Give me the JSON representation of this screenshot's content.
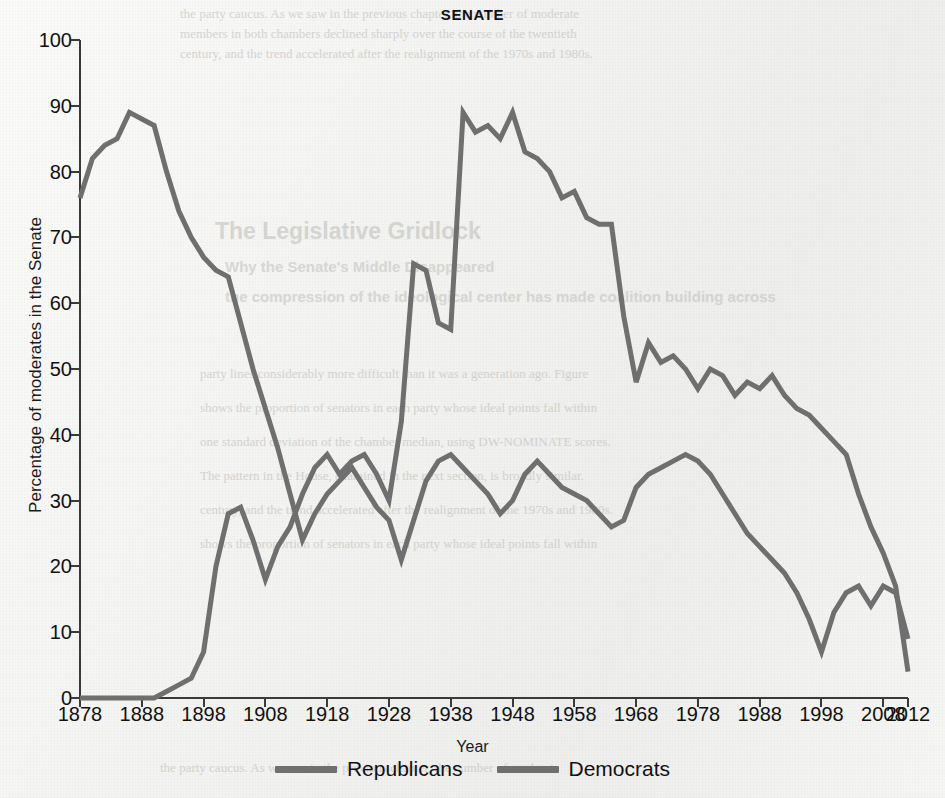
{
  "chart_data": {
    "type": "line",
    "title": "SENATE",
    "xlabel": "Year",
    "ylabel": "Percentage of moderates in the Senate",
    "xlim": [
      1878,
      2012
    ],
    "ylim": [
      0,
      100
    ],
    "grid": false,
    "legend_position": "bottom-center",
    "x_ticks": [
      "1878",
      "1888",
      "1898",
      "1908",
      "1918",
      "1928",
      "1938",
      "1948",
      "1958",
      "1968",
      "1978",
      "1988",
      "1998",
      "2008",
      "2012"
    ],
    "y_ticks": [
      "0",
      "10",
      "20",
      "30",
      "40",
      "50",
      "60",
      "70",
      "80",
      "90",
      "100"
    ],
    "colors": {
      "republicans": "#6f6f6f",
      "democrats": "#6f6f6f",
      "axis": "#3a3a3a",
      "background": "#f2f2f0"
    },
    "x": [
      1878,
      1880,
      1882,
      1884,
      1886,
      1888,
      1890,
      1892,
      1894,
      1896,
      1898,
      1900,
      1902,
      1904,
      1906,
      1908,
      1910,
      1912,
      1914,
      1916,
      1918,
      1920,
      1922,
      1924,
      1926,
      1928,
      1930,
      1932,
      1934,
      1936,
      1938,
      1940,
      1942,
      1944,
      1946,
      1948,
      1950,
      1952,
      1954,
      1956,
      1958,
      1960,
      1962,
      1964,
      1966,
      1968,
      1970,
      1972,
      1974,
      1976,
      1978,
      1980,
      1982,
      1984,
      1986,
      1988,
      1990,
      1992,
      1994,
      1996,
      1998,
      2000,
      2002,
      2004,
      2006,
      2008,
      2010,
      2012
    ],
    "series": [
      {
        "name": "Republicans",
        "values": [
          76,
          82,
          84,
          85,
          89,
          88,
          87,
          80,
          74,
          70,
          67,
          65,
          64,
          57,
          50,
          44,
          38,
          31,
          24,
          28,
          31,
          33,
          35,
          32,
          29,
          27,
          21,
          27,
          33,
          36,
          37,
          35,
          33,
          31,
          28,
          30,
          34,
          36,
          34,
          32,
          31,
          30,
          28,
          26,
          27,
          32,
          34,
          35,
          36,
          37,
          36,
          34,
          31,
          28,
          25,
          23,
          21,
          19,
          16,
          12,
          7,
          13,
          16,
          17,
          14,
          17,
          16,
          9
        ]
      },
      {
        "name": "Democrats",
        "values": [
          0,
          0,
          0,
          0,
          0,
          0,
          0,
          1,
          2,
          3,
          7,
          20,
          28,
          29,
          24,
          18,
          23,
          26,
          31,
          35,
          37,
          34,
          36,
          37,
          34,
          30,
          42,
          66,
          65,
          57,
          56,
          89,
          86,
          87,
          85,
          89,
          83,
          82,
          80,
          76,
          77,
          73,
          72,
          72,
          58,
          48,
          54,
          51,
          52,
          50,
          47,
          50,
          49,
          46,
          48,
          47,
          49,
          46,
          44,
          43,
          41,
          39,
          37,
          31,
          26,
          22,
          17,
          4
        ]
      }
    ]
  },
  "ghost_page": {
    "heading": "The Legislative Gridlock",
    "subheading": "Why the Senate's Middle Disappeared",
    "lines": [
      "the party caucus. As we saw in the previous chapter, the number of moderate",
      "members in both chambers declined sharply over the course of the twentieth",
      "century, and the trend accelerated after the realignment of the 1970s and 1980s.",
      "the compression of the ideological center has made coalition building across",
      "party lines considerably more difficult than it was a generation ago. Figure",
      "shows the proportion of senators in each party whose ideal points fall within",
      "one standard deviation of the chamber median, using DW-NOMINATE scores.",
      "The pattern in the House, examined in the next section, is broadly similar."
    ]
  }
}
